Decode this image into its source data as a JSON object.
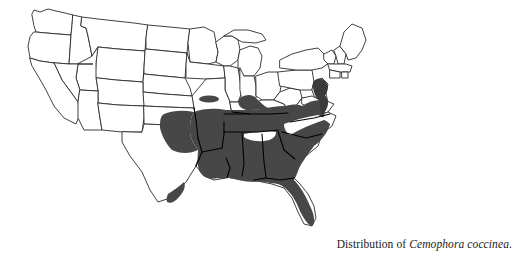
{
  "figure": {
    "name": "distribution-map",
    "kind": "range-map",
    "region": "United States (contiguous)",
    "background_color": "#ffffff",
    "outline_color": "#2b2b2b",
    "range_fill_color": "#474747",
    "state_line_over_color": "#000000"
  },
  "caption": {
    "prefix": "Distribution of ",
    "taxon": "Cemophora coccinea",
    "terminator": "."
  },
  "legend": {
    "shaded_meaning": "Known range",
    "unshaded_meaning": "Outside range"
  },
  "range": {
    "shaded_states": [
      "New Jersey",
      "Delaware",
      "Maryland",
      "Virginia",
      "North Carolina",
      "South Carolina",
      "Georgia",
      "Florida",
      "Alabama",
      "Mississippi",
      "Louisiana",
      "Arkansas",
      "Tennessee",
      "Kentucky",
      "Oklahoma",
      "Texas",
      "Missouri",
      "Indiana"
    ],
    "unshaded_states": [
      "Washington",
      "Oregon",
      "California",
      "Nevada",
      "Idaho",
      "Montana",
      "Wyoming",
      "Utah",
      "Arizona",
      "Colorado",
      "New Mexico",
      "North Dakota",
      "South Dakota",
      "Nebraska",
      "Kansas",
      "Minnesota",
      "Iowa",
      "Wisconsin",
      "Illinois",
      "Michigan",
      "Ohio",
      "Pennsylvania",
      "New York",
      "Vermont",
      "New Hampshire",
      "Maine",
      "Massachusetts",
      "Connecticut",
      "Rhode Island",
      "West Virginia"
    ],
    "disjunct_spots": [
      "Missouri Ozarks",
      "South Texas"
    ],
    "gaps": [
      "Appalachian ridge through the Carolinas"
    ]
  }
}
